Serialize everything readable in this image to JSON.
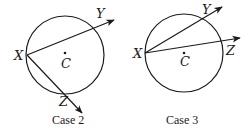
{
  "diagrams": [
    {
      "caption": "Case 2",
      "labels": {
        "x": "X",
        "y": "Y",
        "z": "Z",
        "c": "C"
      },
      "circle": {
        "cx": 65,
        "cy": 55,
        "r": 39
      },
      "point_x": [
        27,
        55
      ],
      "ray_y": {
        "from": [
          27,
          55
        ],
        "to": [
          114,
          20
        ]
      },
      "ray_z": {
        "from": [
          27,
          55
        ],
        "to": [
          82,
          113
        ]
      }
    },
    {
      "caption": "Case 3",
      "labels": {
        "x": "X",
        "y": "Y",
        "z": "Z",
        "c": "C"
      },
      "circle": {
        "cx": 184,
        "cy": 53,
        "r": 39
      },
      "point_x": [
        145,
        53
      ],
      "ray_y": {
        "from": [
          145,
          53
        ],
        "to": [
          222,
          7
        ]
      },
      "ray_z": {
        "from": [
          145,
          53
        ],
        "to": [
          240,
          38
        ]
      }
    }
  ]
}
